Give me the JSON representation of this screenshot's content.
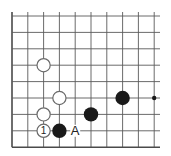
{
  "diagram": {
    "type": "go-board-fragment",
    "colors": {
      "background": "#ffffff",
      "grid_line": "#5a5a5a",
      "edge_line": "#4a4a4a",
      "black_stone": "#1a1a1a",
      "white_stone_fill": "#ffffff",
      "white_stone_stroke": "#6a6a6a",
      "star_point": "#1a1a1a",
      "text": "#222222"
    },
    "grid": {
      "columns_x": [
        12,
        27.8,
        43.6,
        59.4,
        75.2,
        91,
        106.8,
        122.6,
        138.4,
        154.2
      ],
      "rows_y": [
        16,
        32.4,
        48.8,
        65.2,
        81.6,
        98,
        114.4,
        130.8,
        147.2
      ],
      "right_extent": 160,
      "top_extent": 12,
      "edges": [
        "left",
        "bottom"
      ]
    },
    "stones": [
      {
        "color": "white",
        "col": 2,
        "row": 3,
        "label": ""
      },
      {
        "color": "white",
        "col": 3,
        "row": 5,
        "label": ""
      },
      {
        "color": "white",
        "col": 2,
        "row": 6,
        "label": ""
      },
      {
        "color": "white",
        "col": 2,
        "row": 7,
        "label": "1"
      },
      {
        "color": "black",
        "col": 3,
        "row": 7,
        "label": ""
      },
      {
        "color": "black",
        "col": 5,
        "row": 6,
        "label": ""
      },
      {
        "color": "black",
        "col": 7,
        "row": 5,
        "label": ""
      }
    ],
    "star_points": [
      {
        "col": 9,
        "row": 5
      }
    ],
    "markers": [
      {
        "text": "A",
        "col": 4,
        "row": 7
      }
    ]
  }
}
